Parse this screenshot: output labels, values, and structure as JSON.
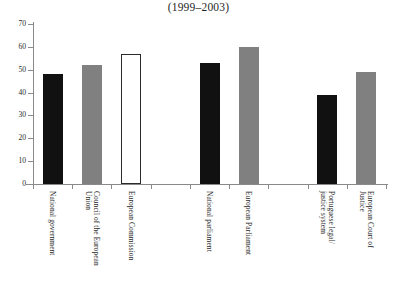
{
  "chart_data": {
    "type": "bar",
    "title": "(1999–2003)",
    "subtitle": "",
    "xlabel": "",
    "ylabel": "",
    "ylim": [
      0,
      70
    ],
    "ytick_labels": [
      "70",
      "60",
      "50",
      "40",
      "30",
      "20",
      "10",
      "0"
    ],
    "ytick_values": [
      70,
      60,
      50,
      40,
      30,
      20,
      10,
      0
    ],
    "grid": false,
    "legend": "none",
    "categories": [
      "National government",
      "Council of the European Union",
      "European Commission",
      "National parliament",
      "European Parliament",
      "Portuguese legal/ justice system",
      "European Court of Justice"
    ],
    "values": [
      48,
      52,
      57,
      53,
      60,
      39,
      49
    ],
    "bar_styles": [
      "dark",
      "gray",
      "white",
      "dark",
      "gray",
      "dark",
      "gray"
    ],
    "colors": {
      "dark": "#111111",
      "gray": "#808080",
      "white": "#ffffff",
      "outline": "#2b2b2b",
      "axis": "#8a8a8a",
      "text": "#1f1f1f",
      "background": "#ffffff"
    },
    "bars": [
      {
        "label": "National government",
        "label_lines": "National government",
        "value": 48,
        "style": "dark",
        "slot": 0
      },
      {
        "label": "Council of the European Union",
        "label_lines": "Council of the European\nUnion",
        "value": 52,
        "style": "gray",
        "slot": 1
      },
      {
        "label": "European Commission",
        "label_lines": "European Commission",
        "value": 57,
        "style": "white",
        "slot": 2
      },
      {
        "label": "National parliament",
        "label_lines": "National parliament",
        "value": 53,
        "style": "dark",
        "slot": 4
      },
      {
        "label": "European Parliament",
        "label_lines": "European Parliament",
        "value": 60,
        "style": "gray",
        "slot": 5
      },
      {
        "label": "Portuguese legal/ justice system",
        "label_lines": "Portuguese legal/\njustice system",
        "value": 39,
        "style": "dark",
        "slot": 7
      },
      {
        "label": "European Court of Justice",
        "label_lines": "European Court of\nJustice",
        "value": 49,
        "style": "gray",
        "slot": 8
      }
    ],
    "empty_slots": [
      3,
      6
    ],
    "slot_count": 9
  }
}
